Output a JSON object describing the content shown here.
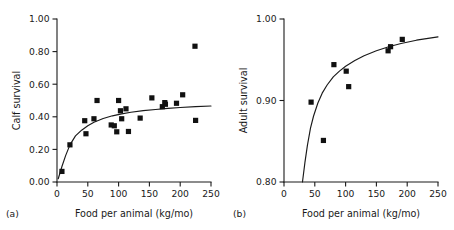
{
  "figure": {
    "panels": [
      {
        "key": "a",
        "letter": "(a)",
        "chart_data": {
          "type": "scatter",
          "title": "",
          "xlabel": "Food per animal (kg/mo)",
          "ylabel": "Calf survival",
          "xlim": [
            0,
            250
          ],
          "ylim": [
            0.0,
            1.0
          ],
          "xticks": [
            0,
            50,
            100,
            150,
            200,
            250
          ],
          "xticklabels": [
            "0",
            "50",
            "100",
            "150",
            "200",
            "250"
          ],
          "yticks": [
            0.0,
            0.2,
            0.4,
            0.6,
            0.8,
            1.0
          ],
          "yticklabels": [
            "0.00",
            "0.20",
            "0.40",
            "0.60",
            "0.80",
            "1.00"
          ],
          "grid": false,
          "legend": false,
          "marker": "filled-square",
          "points": [
            {
              "x": 8,
              "y": 0.065
            },
            {
              "x": 21,
              "y": 0.228
            },
            {
              "x": 45,
              "y": 0.376
            },
            {
              "x": 47,
              "y": 0.296
            },
            {
              "x": 60,
              "y": 0.388
            },
            {
              "x": 65,
              "y": 0.5
            },
            {
              "x": 88,
              "y": 0.35
            },
            {
              "x": 93,
              "y": 0.345
            },
            {
              "x": 97,
              "y": 0.308
            },
            {
              "x": 100,
              "y": 0.5
            },
            {
              "x": 103,
              "y": 0.437
            },
            {
              "x": 105,
              "y": 0.388
            },
            {
              "x": 112,
              "y": 0.449
            },
            {
              "x": 116,
              "y": 0.31
            },
            {
              "x": 135,
              "y": 0.392
            },
            {
              "x": 154,
              "y": 0.516
            },
            {
              "x": 171,
              "y": 0.462
            },
            {
              "x": 175,
              "y": 0.487
            },
            {
              "x": 176,
              "y": 0.477
            },
            {
              "x": 194,
              "y": 0.483
            },
            {
              "x": 204,
              "y": 0.535
            },
            {
              "x": 224,
              "y": 0.833
            },
            {
              "x": 225,
              "y": 0.378
            }
          ],
          "fit_curve": {
            "description": "saturating rise",
            "points": [
              {
                "x": 2,
                "y": 0.02
              },
              {
                "x": 8,
                "y": 0.095
              },
              {
                "x": 14,
                "y": 0.162
              },
              {
                "x": 21,
                "y": 0.228
              },
              {
                "x": 30,
                "y": 0.283
              },
              {
                "x": 40,
                "y": 0.318
              },
              {
                "x": 50,
                "y": 0.345
              },
              {
                "x": 60,
                "y": 0.366
              },
              {
                "x": 75,
                "y": 0.39
              },
              {
                "x": 90,
                "y": 0.406
              },
              {
                "x": 105,
                "y": 0.418
              },
              {
                "x": 120,
                "y": 0.428
              },
              {
                "x": 140,
                "y": 0.438
              },
              {
                "x": 160,
                "y": 0.445
              },
              {
                "x": 180,
                "y": 0.452
              },
              {
                "x": 200,
                "y": 0.457
              },
              {
                "x": 225,
                "y": 0.462
              },
              {
                "x": 250,
                "y": 0.466
              }
            ]
          }
        }
      },
      {
        "key": "b",
        "letter": "(b)",
        "chart_data": {
          "type": "scatter",
          "title": "",
          "xlabel": "Food per animal (kg/mo)",
          "ylabel": "Adult survival",
          "xlim": [
            0,
            250
          ],
          "ylim": [
            0.8,
            1.0
          ],
          "xticks": [
            0,
            50,
            100,
            150,
            200,
            250
          ],
          "xticklabels": [
            "0",
            "50",
            "100",
            "150",
            "200",
            "250"
          ],
          "yticks": [
            0.8,
            0.9,
            1.0
          ],
          "yticklabels": [
            "0.80",
            "0.90",
            "1.00"
          ],
          "grid": false,
          "legend": false,
          "marker": "filled-square",
          "points": [
            {
              "x": 44,
              "y": 0.898
            },
            {
              "x": 64,
              "y": 0.851
            },
            {
              "x": 81,
              "y": 0.944
            },
            {
              "x": 101,
              "y": 0.936
            },
            {
              "x": 105,
              "y": 0.917
            },
            {
              "x": 169,
              "y": 0.961
            },
            {
              "x": 173,
              "y": 0.966
            },
            {
              "x": 192,
              "y": 0.975
            }
          ],
          "fit_curve": {
            "description": "steep saturating rise",
            "points": [
              {
                "x": 30,
                "y": 0.8
              },
              {
                "x": 34,
                "y": 0.824
              },
              {
                "x": 38,
                "y": 0.845
              },
              {
                "x": 43,
                "y": 0.866
              },
              {
                "x": 48,
                "y": 0.881
              },
              {
                "x": 55,
                "y": 0.897
              },
              {
                "x": 62,
                "y": 0.909
              },
              {
                "x": 70,
                "y": 0.919
              },
              {
                "x": 80,
                "y": 0.929
              },
              {
                "x": 90,
                "y": 0.936
              },
              {
                "x": 100,
                "y": 0.942
              },
              {
                "x": 115,
                "y": 0.949
              },
              {
                "x": 130,
                "y": 0.955
              },
              {
                "x": 150,
                "y": 0.961
              },
              {
                "x": 170,
                "y": 0.966
              },
              {
                "x": 190,
                "y": 0.97
              },
              {
                "x": 215,
                "y": 0.974
              },
              {
                "x": 250,
                "y": 0.978
              }
            ]
          }
        }
      }
    ],
    "style": {
      "axis_color": "#1a1a1a",
      "marker_color": "#111111",
      "curve_color": "#1a1a1a",
      "background": "#ffffff",
      "marker_size": 5.2
    }
  }
}
